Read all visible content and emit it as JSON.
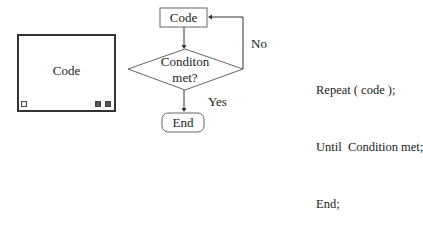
{
  "block_illustration": {
    "cloud_label": "Code",
    "icons": [
      "loop-indicator-icon",
      "add-icon",
      "settings-icon"
    ]
  },
  "flowchart": {
    "process_box": "Code",
    "decision_line1": "Conditon",
    "decision_line2": "met?",
    "no_label": "No",
    "yes_label": "Yes",
    "terminal_box": "End"
  },
  "pseudocode": {
    "lines": [
      "Repeat ( code );",
      "Until  Condition met;",
      "End;"
    ]
  }
}
